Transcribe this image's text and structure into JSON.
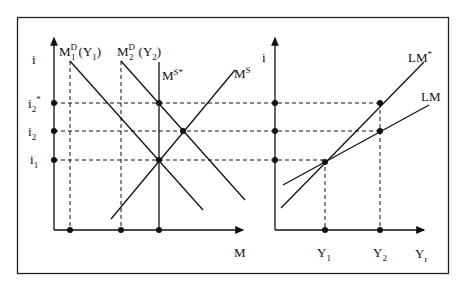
{
  "left_panel": {
    "y_axis_label": "i",
    "x_axis_label": "M",
    "y_ticks": [
      {
        "main": "i",
        "sub": "2",
        "sup": "*"
      },
      {
        "main": "i",
        "sub": "2",
        "sup": ""
      },
      {
        "main": "i",
        "sub": "1",
        "sup": ""
      }
    ],
    "curves": {
      "md1": {
        "main": "M",
        "sub": "1",
        "sup": "D",
        "paren": "(Y",
        "paren_sub": "1",
        "paren_close": ")"
      },
      "md2": {
        "main": "M",
        "sub": "2",
        "sup": "D",
        "paren": "(Y",
        "paren_sub": "2",
        "paren_close": ")"
      },
      "ms_star": {
        "main": "M",
        "sup": "S*"
      },
      "ms": {
        "main": "M",
        "sup": "S"
      }
    }
  },
  "right_panel": {
    "y_axis_label": "i",
    "x_ticks": [
      {
        "main": "Y",
        "sub": "1"
      },
      {
        "main": "Y",
        "sub": "2"
      }
    ],
    "x_axis_label": {
      "main": "Y",
      "sub": "r"
    },
    "curves": {
      "lm_star": {
        "main": "LM",
        "sup": "*"
      },
      "lm": {
        "main": "LM"
      }
    }
  }
}
